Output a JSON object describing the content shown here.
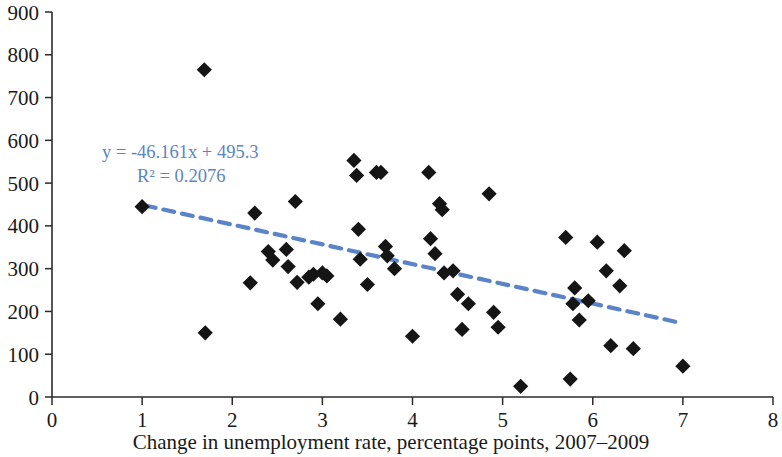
{
  "chart_data": {
    "type": "scatter",
    "title": "",
    "xlabel": "Change in unemployment rate, percentage points, 2007–2009",
    "ylabel": "",
    "xlim": [
      0,
      8
    ],
    "ylim": [
      0,
      900
    ],
    "xticks": [
      0,
      1,
      2,
      3,
      4,
      5,
      6,
      7,
      8
    ],
    "yticks": [
      0,
      100,
      200,
      300,
      400,
      500,
      600,
      700,
      800,
      900
    ],
    "xtick_labels": [
      "0",
      "1",
      "2",
      "3",
      "4",
      "5",
      "6",
      "7",
      "8"
    ],
    "ytick_labels": [
      "0",
      "100",
      "200",
      "300",
      "400",
      "500",
      "600",
      "700",
      "800",
      "900"
    ],
    "grid": false,
    "legend": false,
    "marker_style": "diamond",
    "marker_color": "#151515",
    "trendline": {
      "style": "dashed",
      "color": "#5b84c8",
      "slope": -46.161,
      "intercept": 495.3,
      "x_start": 1.03,
      "x_end": 7.0,
      "equation_label": "y = -46.161x + 495.3",
      "r2_label": "R² = 0.2076",
      "r_squared": 0.2076
    },
    "points": [
      [
        1.0,
        445
      ],
      [
        1.69,
        765
      ],
      [
        1.7,
        150
      ],
      [
        2.2,
        267
      ],
      [
        2.25,
        430
      ],
      [
        2.4,
        340
      ],
      [
        2.45,
        320
      ],
      [
        2.6,
        345
      ],
      [
        2.62,
        305
      ],
      [
        2.7,
        457
      ],
      [
        2.72,
        268
      ],
      [
        2.85,
        280
      ],
      [
        2.9,
        287
      ],
      [
        2.95,
        218
      ],
      [
        3.0,
        290
      ],
      [
        3.05,
        283
      ],
      [
        3.2,
        182
      ],
      [
        3.35,
        553
      ],
      [
        3.38,
        518
      ],
      [
        3.4,
        392
      ],
      [
        3.42,
        322
      ],
      [
        3.5,
        263
      ],
      [
        3.6,
        525
      ],
      [
        3.65,
        525
      ],
      [
        3.7,
        352
      ],
      [
        3.72,
        330
      ],
      [
        3.8,
        300
      ],
      [
        4.0,
        142
      ],
      [
        4.18,
        525
      ],
      [
        4.2,
        370
      ],
      [
        4.25,
        335
      ],
      [
        4.3,
        452
      ],
      [
        4.33,
        438
      ],
      [
        4.35,
        290
      ],
      [
        4.45,
        295
      ],
      [
        4.5,
        240
      ],
      [
        4.55,
        158
      ],
      [
        4.62,
        218
      ],
      [
        4.85,
        475
      ],
      [
        4.9,
        198
      ],
      [
        4.95,
        163
      ],
      [
        5.2,
        25
      ],
      [
        5.7,
        373
      ],
      [
        5.75,
        42
      ],
      [
        5.78,
        218
      ],
      [
        5.8,
        255
      ],
      [
        5.85,
        180
      ],
      [
        5.95,
        225
      ],
      [
        6.05,
        362
      ],
      [
        6.15,
        295
      ],
      [
        6.2,
        120
      ],
      [
        6.3,
        260
      ],
      [
        6.35,
        342
      ],
      [
        6.45,
        113
      ],
      [
        7.0,
        72
      ]
    ]
  }
}
